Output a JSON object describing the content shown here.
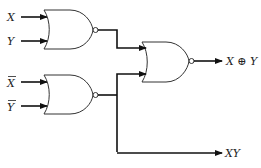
{
  "diagram": {
    "type": "logic-circuit",
    "inputs": [
      {
        "id": "x",
        "label": "X",
        "overbar": false
      },
      {
        "id": "y",
        "label": "Y",
        "overbar": false
      },
      {
        "id": "xbar",
        "label": "X",
        "overbar": true
      },
      {
        "id": "ybar",
        "label": "Y",
        "overbar": true
      }
    ],
    "gates": [
      {
        "id": "g1",
        "kind": "NOR",
        "inputs": [
          "X",
          "Y"
        ]
      },
      {
        "id": "g2",
        "kind": "NOR",
        "inputs": [
          "X̄",
          "Ȳ"
        ]
      },
      {
        "id": "g3",
        "kind": "NOR",
        "inputs": [
          "g1",
          "g2"
        ]
      }
    ],
    "outputs": [
      {
        "id": "xor",
        "label": "X ⊕ Y",
        "source": "g3"
      },
      {
        "id": "and",
        "label": "XY",
        "source": "g2"
      }
    ],
    "colors": {
      "line": "#111111",
      "gate_outline": "#333333",
      "background": "#ffffff"
    }
  }
}
